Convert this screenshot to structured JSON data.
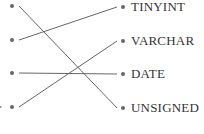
{
  "diagram": {
    "type": "matching",
    "colors": {
      "line": "#666666",
      "dot": "#666666",
      "text": "#333333"
    },
    "left_dots": [
      {
        "id": "L1",
        "x": 12,
        "y": 6
      },
      {
        "id": "L2",
        "x": 12,
        "y": 40
      },
      {
        "id": "L3",
        "x": 12,
        "y": 73
      },
      {
        "id": "L4",
        "x": 12,
        "y": 107
      }
    ],
    "right_items": [
      {
        "id": "R1",
        "label": "TINYINT",
        "dot_x": 123,
        "y": 7
      },
      {
        "id": "R2",
        "label": "VARCHAR",
        "dot_x": 123,
        "y": 41
      },
      {
        "id": "R3",
        "label": "DATE",
        "dot_x": 123,
        "y": 74
      },
      {
        "id": "R4",
        "label": "UNSIGNED",
        "dot_x": 123,
        "y": 108
      }
    ],
    "connections": [
      {
        "from": "L1",
        "to": "R4"
      },
      {
        "from": "L2",
        "to": "R1"
      },
      {
        "from": "L3",
        "to": "R3"
      },
      {
        "from": "L4",
        "to": "R2"
      }
    ]
  }
}
